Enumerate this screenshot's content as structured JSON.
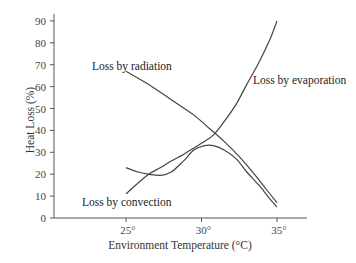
{
  "chart_data": {
    "type": "line",
    "title": "",
    "xlabel": "Environment Temperature (°C)",
    "ylabel": "Heat Loss (%)",
    "xlim": [
      21,
      37
    ],
    "ylim": [
      0,
      90
    ],
    "x_ticks": [
      25,
      30,
      35
    ],
    "x_tick_labels": [
      "25°",
      "30°",
      "35°"
    ],
    "y_ticks": [
      0,
      10,
      20,
      30,
      40,
      50,
      60,
      70,
      80,
      90
    ],
    "y_tick_labels": [
      "0",
      "10",
      "20",
      "30",
      "40",
      "50",
      "60",
      "70",
      "80",
      "90"
    ],
    "grid": false,
    "legend": "none (curves labeled inline)",
    "series": [
      {
        "name": "Loss by radiation",
        "x": [
          25,
          26.5,
          28,
          29.5,
          30.5,
          31.5,
          32.5,
          33.5,
          34.3,
          35
        ],
        "values": [
          67,
          61,
          54,
          47,
          41,
          35,
          28,
          20,
          13,
          7
        ]
      },
      {
        "name": "Loss by convection",
        "x": [
          25,
          25.8,
          26.5,
          27.3,
          28,
          28.8,
          29.5,
          30.2,
          30.8,
          31.5,
          32.3,
          33,
          33.8,
          34.5,
          35
        ],
        "values": [
          23,
          21,
          20,
          19.5,
          21,
          26,
          31,
          33,
          33,
          31,
          27,
          21,
          15,
          9,
          5
        ]
      },
      {
        "name": "Loss by evaporation",
        "x": [
          25,
          25.8,
          26.5,
          27.3,
          28,
          28.8,
          29.5,
          30.2,
          30.8,
          31.5,
          32.3,
          33,
          33.8,
          34.5,
          35
        ],
        "values": [
          11,
          16,
          20,
          23,
          26,
          29,
          32,
          35,
          38,
          44,
          52,
          61,
          71,
          81,
          90
        ]
      }
    ],
    "annotations": [
      {
        "text": "Loss by radiation",
        "near": [
          27,
          70
        ]
      },
      {
        "text": "Loss by evaporation",
        "near": [
          35.5,
          61
        ]
      },
      {
        "text": "Loss by convection",
        "near": [
          26,
          6
        ]
      }
    ]
  },
  "labels": {
    "radiation": "Loss by radiation",
    "evaporation": "Loss by evaporation",
    "convection": "Loss by convection",
    "xlabel": "Environment Temperature (°C)",
    "ylabel": "Heat Loss (%)"
  }
}
